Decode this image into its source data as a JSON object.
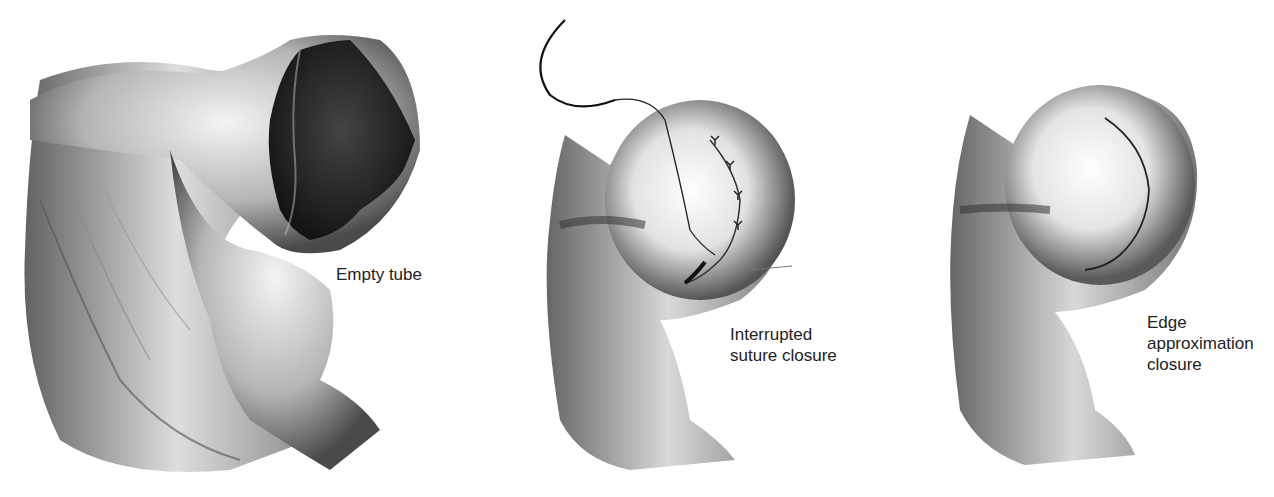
{
  "figure": {
    "panels": [
      {
        "id": "empty-tube",
        "label": "Empty tube"
      },
      {
        "id": "interrupted-suture",
        "label": "Interrupted\nsuture closure"
      },
      {
        "id": "edge-approximation",
        "label": "Edge\napproximation\nclosure"
      }
    ],
    "colors": {
      "background": "#ffffff",
      "tissue_dark": "#2a2a2a",
      "tissue_mid": "#8a8a8a",
      "tissue_light": "#f2f2f2",
      "text": "#222222"
    }
  }
}
